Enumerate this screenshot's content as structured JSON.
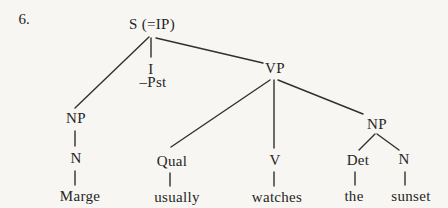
{
  "page": {
    "paper_color": "#f7f6f2",
    "ink_color": "#32302a"
  },
  "figure": {
    "item_number": "6.",
    "kind": "syntax-tree",
    "sentence": "Marge usually watches the sunset"
  },
  "tree": {
    "nodes": {
      "s": {
        "label": "S (=IP)"
      },
      "np_subject": {
        "label": "NP"
      },
      "i": {
        "label": "I"
      },
      "i_tense": {
        "label": "–Pst"
      },
      "vp": {
        "label": "VP"
      },
      "n_subject": {
        "label": "N"
      },
      "word_marge": {
        "label": "Marge"
      },
      "qual": {
        "label": "Qual"
      },
      "word_usually": {
        "label": "usually"
      },
      "v": {
        "label": "V"
      },
      "word_watches": {
        "label": "watches"
      },
      "np_object": {
        "label": "NP"
      },
      "det": {
        "label": "Det"
      },
      "word_the": {
        "label": "the"
      },
      "n_object": {
        "label": "N"
      },
      "word_sunset": {
        "label": "sunset"
      }
    },
    "edges": [
      {
        "from": "s",
        "to": "np_subject"
      },
      {
        "from": "s",
        "to": "i"
      },
      {
        "from": "s",
        "to": "vp"
      },
      {
        "from": "np_subject",
        "to": "n_subject"
      },
      {
        "from": "n_subject",
        "to": "word_marge"
      },
      {
        "from": "vp",
        "to": "qual"
      },
      {
        "from": "vp",
        "to": "v"
      },
      {
        "from": "vp",
        "to": "np_object"
      },
      {
        "from": "qual",
        "to": "word_usually"
      },
      {
        "from": "v",
        "to": "word_watches"
      },
      {
        "from": "np_object",
        "to": "det"
      },
      {
        "from": "np_object",
        "to": "n_object"
      },
      {
        "from": "det",
        "to": "word_the"
      },
      {
        "from": "n_object",
        "to": "word_sunset"
      }
    ]
  }
}
